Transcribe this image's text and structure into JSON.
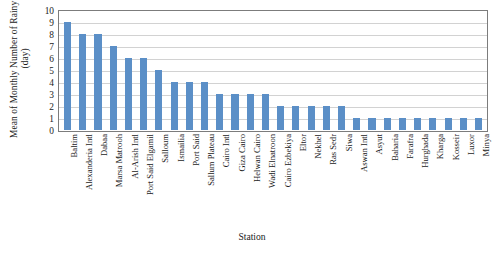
{
  "chart_data": {
    "type": "bar",
    "title": "",
    "xlabel": "Station",
    "ylabel": "Mean of Monthly Number of Rainy Days (day)",
    "ylabel_line1": "Mean of Monthly Number of Rainy Days",
    "ylabel_line2": "(day)",
    "ylim": [
      0,
      10
    ],
    "ytick_values": [
      0,
      1,
      2,
      3,
      4,
      5,
      6,
      7,
      8,
      9,
      10
    ],
    "ytick_labels": [
      "0",
      "1",
      "2",
      "3",
      "4",
      "5",
      "6",
      "7",
      "8",
      "9",
      "10"
    ],
    "grid": "horizontal",
    "legend": "none",
    "bar_color": "#5b8fc7",
    "plot_border_color": "#7c7c7c",
    "gridline_color": "#d2d2d2",
    "categories": [
      "Baltim",
      "Alexanderia Intl",
      "Dabaa",
      "Marsa Matrooh",
      "Al-Arish Intl",
      "Port Said Elgamil",
      "Salloum",
      "Ismailia",
      "Port Said",
      "Sallum Plateau",
      "Cairo Intl",
      "Giza Cairo",
      "Helwan Cairo",
      "Wadi Elnatroon",
      "Cairo Ezbekiya",
      "Eltor",
      "Nekhel",
      "Ras Sedr",
      "Siwa",
      "Aswan Intl",
      "Asyut",
      "Baharia",
      "Farafra",
      "Hurghada",
      "Kharga",
      "Kosseir",
      "Luxor",
      "Minya"
    ],
    "values": [
      9,
      8,
      8,
      7,
      6,
      6,
      5,
      4,
      4,
      4,
      3,
      3,
      3,
      3,
      2,
      2,
      2,
      2,
      2,
      1,
      1,
      1,
      1,
      1,
      1,
      1,
      1,
      1
    ]
  }
}
